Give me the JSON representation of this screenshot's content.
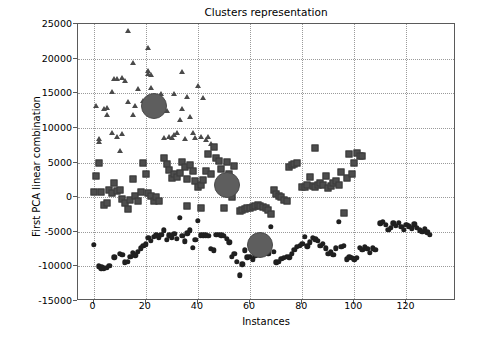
{
  "chart_data": {
    "type": "scatter",
    "title": "Clusters representation",
    "xlabel": "Instances",
    "ylabel": "First PCA linear combination",
    "xlim": [
      -6,
      139
    ],
    "ylim": [
      -15000,
      25000
    ],
    "xticks": [
      0,
      20,
      40,
      60,
      80,
      100,
      120
    ],
    "xticklabels": [
      "0",
      "20",
      "40",
      "60",
      "80",
      "100",
      "120"
    ],
    "yticks": [
      -15000,
      -10000,
      -5000,
      0,
      5000,
      10000,
      15000,
      20000,
      25000
    ],
    "yticklabels": [
      "-15000",
      "-10000",
      "-5000",
      "0",
      "5000",
      "10000",
      "15000",
      "20000",
      "25000"
    ],
    "grid": true,
    "grid_style": "dotted",
    "legend": null,
    "colors": {
      "cluster_triangle": "#4a4a4a",
      "cluster_square": "#4d4d4d",
      "cluster_circle": "#1f1f1f",
      "centroid": "#5e5e5e",
      "axis": "#5a5a5a",
      "grid": "#9a9a9a",
      "background": "#ffffff"
    },
    "series": [
      {
        "name": "cluster-triangles",
        "marker": "triangle",
        "color": "#4a4a4a",
        "points": [
          [
            1,
            13100
          ],
          [
            2,
            7900
          ],
          [
            2,
            8400
          ],
          [
            4,
            12700
          ],
          [
            5,
            12900
          ],
          [
            5,
            11800
          ],
          [
            7,
            15200
          ],
          [
            7,
            9200
          ],
          [
            8,
            17000
          ],
          [
            9,
            17100
          ],
          [
            9,
            8700
          ],
          [
            10,
            6700
          ],
          [
            11,
            17200
          ],
          [
            11,
            9100
          ],
          [
            12,
            16800
          ],
          [
            13,
            24000
          ],
          [
            13,
            13700
          ],
          [
            15,
            19400
          ],
          [
            15,
            11900
          ],
          [
            16,
            13100
          ],
          [
            17,
            15600
          ],
          [
            19,
            13900
          ],
          [
            20,
            13600
          ],
          [
            21,
            21500
          ],
          [
            21,
            17800
          ],
          [
            21,
            18200
          ],
          [
            22,
            15800
          ],
          [
            22,
            17600
          ],
          [
            23,
            13200
          ],
          [
            24,
            13500
          ],
          [
            25,
            12100
          ],
          [
            26,
            14900
          ],
          [
            27,
            8600
          ],
          [
            28,
            12500
          ],
          [
            29,
            8700
          ],
          [
            30,
            8500
          ],
          [
            31,
            8900
          ],
          [
            31,
            14900
          ],
          [
            32,
            9200
          ],
          [
            33,
            11200
          ],
          [
            34,
            18000
          ],
          [
            34,
            12700
          ],
          [
            35,
            8400
          ],
          [
            36,
            14400
          ],
          [
            37,
            11500
          ],
          [
            38,
            9200
          ],
          [
            39,
            8600
          ],
          [
            40,
            16000
          ],
          [
            41,
            8700
          ],
          [
            42,
            14300
          ],
          [
            43,
            8300
          ],
          [
            44,
            8700
          ],
          [
            45,
            7700
          ]
        ]
      },
      {
        "name": "cluster-squares",
        "marker": "square",
        "color": "#4d4d4d",
        "points": [
          [
            0,
            700
          ],
          [
            1,
            3100
          ],
          [
            2,
            4900
          ],
          [
            3,
            700
          ],
          [
            4,
            -1200
          ],
          [
            5,
            -900
          ],
          [
            6,
            1000
          ],
          [
            7,
            600
          ],
          [
            8,
            2000
          ],
          [
            9,
            900
          ],
          [
            10,
            1100
          ],
          [
            11,
            -300
          ],
          [
            12,
            -800
          ],
          [
            13,
            -1700
          ],
          [
            14,
            -400
          ],
          [
            15,
            2600
          ],
          [
            16,
            200
          ],
          [
            17,
            -600
          ],
          [
            18,
            800
          ],
          [
            19,
            5000
          ],
          [
            20,
            3300
          ],
          [
            21,
            600
          ],
          [
            22,
            200
          ],
          [
            23,
            -600
          ],
          [
            24,
            0
          ],
          [
            25,
            -500
          ],
          [
            27,
            5600
          ],
          [
            28,
            4800
          ],
          [
            29,
            3900
          ],
          [
            30,
            2800
          ],
          [
            31,
            3400
          ],
          [
            32,
            2900
          ],
          [
            33,
            3500
          ],
          [
            34,
            5100
          ],
          [
            35,
            4300
          ],
          [
            36,
            2600
          ],
          [
            36,
            -1300
          ],
          [
            37,
            4600
          ],
          [
            38,
            3800
          ],
          [
            39,
            2300
          ],
          [
            40,
            1500
          ],
          [
            41,
            1800
          ],
          [
            41,
            -1500
          ],
          [
            42,
            2500
          ],
          [
            43,
            3800
          ],
          [
            44,
            6200
          ],
          [
            45,
            3400
          ],
          [
            46,
            7300
          ],
          [
            47,
            5600
          ],
          [
            48,
            5200
          ],
          [
            49,
            4000
          ],
          [
            50,
            -1600
          ],
          [
            51,
            5100
          ],
          [
            52,
            3400
          ],
          [
            53,
            0
          ],
          [
            54,
            4500
          ],
          [
            56,
            -2000
          ],
          [
            57,
            -1900
          ],
          [
            58,
            -1700
          ],
          [
            59,
            -1600
          ],
          [
            60,
            -1500
          ],
          [
            61,
            -1400
          ],
          [
            62,
            -1300
          ],
          [
            63,
            -1200
          ],
          [
            64,
            -1300
          ],
          [
            65,
            -1400
          ],
          [
            66,
            -1600
          ],
          [
            67,
            -1800
          ],
          [
            68,
            -2400
          ],
          [
            69,
            1100
          ],
          [
            70,
            400
          ],
          [
            71,
            200
          ],
          [
            72,
            0
          ],
          [
            73,
            -400
          ],
          [
            74,
            -600
          ],
          [
            75,
            4400
          ],
          [
            76,
            4600
          ],
          [
            77,
            4800
          ],
          [
            78,
            4900
          ],
          [
            80,
            1500
          ],
          [
            81,
            1400
          ],
          [
            82,
            1700
          ],
          [
            83,
            2900
          ],
          [
            84,
            1600
          ],
          [
            85,
            7100
          ],
          [
            85,
            1400
          ],
          [
            86,
            1800
          ],
          [
            87,
            2000
          ],
          [
            88,
            1800
          ],
          [
            89,
            3000
          ],
          [
            90,
            1300
          ],
          [
            91,
            1600
          ],
          [
            92,
            2000
          ],
          [
            93,
            2400
          ],
          [
            94,
            1800
          ],
          [
            95,
            3700
          ],
          [
            96,
            -2300
          ],
          [
            97,
            2700
          ],
          [
            98,
            6200
          ],
          [
            99,
            3400
          ],
          [
            100,
            5000
          ],
          [
            101,
            6300
          ],
          [
            102,
            6000
          ],
          [
            103,
            5900
          ]
        ]
      },
      {
        "name": "cluster-circles",
        "marker": "circle",
        "color": "#1f1f1f",
        "points": [
          [
            0,
            -6900
          ],
          [
            2,
            -10000
          ],
          [
            3,
            -10100
          ],
          [
            3,
            -10300
          ],
          [
            4,
            -10300
          ],
          [
            5,
            -10200
          ],
          [
            6,
            -9900
          ],
          [
            8,
            -8700
          ],
          [
            10,
            -8200
          ],
          [
            11,
            -8300
          ],
          [
            12,
            -9400
          ],
          [
            13,
            -9300
          ],
          [
            14,
            -8600
          ],
          [
            15,
            -8000
          ],
          [
            16,
            -8400
          ],
          [
            17,
            -7900
          ],
          [
            18,
            -7400
          ],
          [
            19,
            -7000
          ],
          [
            20,
            -6800
          ],
          [
            21,
            -5900
          ],
          [
            22,
            -6300
          ],
          [
            23,
            -5700
          ],
          [
            24,
            -5500
          ],
          [
            25,
            -5800
          ],
          [
            26,
            -5400
          ],
          [
            27,
            -4800
          ],
          [
            28,
            -6200
          ],
          [
            29,
            -5500
          ],
          [
            30,
            -5800
          ],
          [
            31,
            -5300
          ],
          [
            32,
            -6000
          ],
          [
            33,
            -3000
          ],
          [
            34,
            -5600
          ],
          [
            35,
            -6400
          ],
          [
            36,
            -5200
          ],
          [
            37,
            -4800
          ],
          [
            38,
            -7300
          ],
          [
            39,
            -6200
          ],
          [
            40,
            -3400
          ],
          [
            41,
            -5500
          ],
          [
            42,
            -5500
          ],
          [
            43,
            -5500
          ],
          [
            44,
            -5600
          ],
          [
            45,
            -7500
          ],
          [
            46,
            -7700
          ],
          [
            47,
            -5400
          ],
          [
            48,
            -5400
          ],
          [
            49,
            -5500
          ],
          [
            50,
            -5600
          ],
          [
            51,
            -6000
          ],
          [
            52,
            -6500
          ],
          [
            53,
            -8600
          ],
          [
            54,
            -8200
          ],
          [
            55,
            -9300
          ],
          [
            56,
            -11300
          ],
          [
            57,
            -9700
          ],
          [
            58,
            -7700
          ],
          [
            59,
            -8700
          ],
          [
            60,
            -8600
          ],
          [
            61,
            -9000
          ],
          [
            62,
            -8400
          ],
          [
            63,
            -8300
          ],
          [
            64,
            -7400
          ],
          [
            65,
            -6900
          ],
          [
            66,
            -8000
          ],
          [
            67,
            -8200
          ],
          [
            68,
            -4300
          ],
          [
            69,
            -7900
          ],
          [
            70,
            -9400
          ],
          [
            71,
            -9300
          ],
          [
            72,
            -8900
          ],
          [
            73,
            -8800
          ],
          [
            74,
            -8600
          ],
          [
            75,
            -8700
          ],
          [
            76,
            -8200
          ],
          [
            77,
            -7600
          ],
          [
            78,
            -7200
          ],
          [
            79,
            -7000
          ],
          [
            80,
            -6700
          ],
          [
            81,
            -5700
          ],
          [
            82,
            -7100
          ],
          [
            83,
            -6500
          ],
          [
            84,
            -5900
          ],
          [
            85,
            -6100
          ],
          [
            86,
            -6300
          ],
          [
            87,
            -7000
          ],
          [
            88,
            -6700
          ],
          [
            89,
            -7400
          ],
          [
            90,
            -8200
          ],
          [
            91,
            -7900
          ],
          [
            92,
            -8300
          ],
          [
            93,
            -7400
          ],
          [
            94,
            -3600
          ],
          [
            95,
            -7200
          ],
          [
            96,
            -7000
          ],
          [
            97,
            -9000
          ],
          [
            98,
            -8700
          ],
          [
            99,
            -8800
          ],
          [
            100,
            -9000
          ],
          [
            101,
            -8800
          ],
          [
            102,
            -7300
          ],
          [
            103,
            -7600
          ],
          [
            104,
            -7200
          ],
          [
            105,
            -7500
          ],
          [
            106,
            -8000
          ],
          [
            107,
            -7400
          ],
          [
            108,
            -7600
          ],
          [
            110,
            -3800
          ],
          [
            111,
            -3600
          ],
          [
            112,
            -4000
          ],
          [
            113,
            -4700
          ],
          [
            114,
            -4400
          ],
          [
            115,
            -3800
          ],
          [
            116,
            -4100
          ],
          [
            117,
            -3700
          ],
          [
            118,
            -4300
          ],
          [
            119,
            -4700
          ],
          [
            120,
            -4000
          ],
          [
            121,
            -4200
          ],
          [
            122,
            -4500
          ],
          [
            123,
            -3900
          ],
          [
            124,
            -4400
          ],
          [
            125,
            -4800
          ],
          [
            126,
            -5000
          ],
          [
            127,
            -4600
          ],
          [
            128,
            -5100
          ],
          [
            129,
            -5400
          ]
        ]
      },
      {
        "name": "centroids",
        "marker": "large-circle",
        "color": "#5e5e5e",
        "points": [
          [
            23,
            13100
          ],
          [
            51,
            1800
          ],
          [
            64,
            -6900
          ]
        ]
      }
    ]
  }
}
